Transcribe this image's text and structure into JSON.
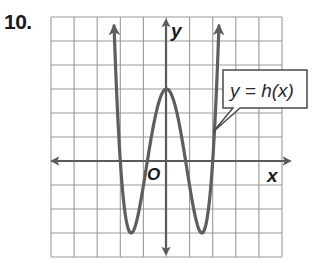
{
  "problem": {
    "number": "10."
  },
  "graph": {
    "x_axis_label": "x",
    "y_axis_label": "y",
    "origin_label": "O",
    "function_label": "y = h(x)",
    "grid": {
      "columns": 10,
      "rows": 10,
      "x_range": [
        -5,
        5
      ],
      "y_range": [
        -4,
        6
      ]
    },
    "colors": {
      "grid": "#9a9a9a",
      "axis": "#5a5a5a",
      "curve": "#5e5e5e"
    }
  },
  "chart_data": {
    "type": "line",
    "title": "",
    "xlabel": "x",
    "ylabel": "y",
    "xlim": [
      -5,
      5
    ],
    "ylim": [
      -4,
      6
    ],
    "grid": true,
    "series": [
      {
        "name": "y = h(x)",
        "description": "quartic, opens upward, arrows on both ends",
        "key_points": {
          "x_intercepts": [
            -2,
            -0.83,
            0.83,
            2
          ],
          "local_max": [
            0,
            3
          ],
          "local_min": [
            [
              -1.53,
              -3
            ],
            [
              1.53,
              -3
            ]
          ]
        },
        "x": [
          -2.27,
          -2,
          -1.53,
          -0.83,
          0,
          0.83,
          1.53,
          2,
          2.27
        ],
        "y": [
          5.6,
          0,
          -3,
          0,
          3,
          0,
          -3,
          0,
          5.6
        ]
      }
    ]
  }
}
